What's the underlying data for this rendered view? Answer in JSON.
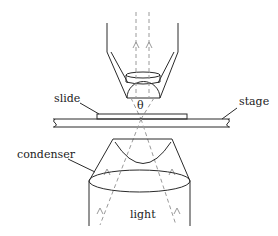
{
  "diagram": {
    "labels": {
      "slide": "slide",
      "stage": "stage",
      "condenser": "condenser",
      "light": "light",
      "angle": "θ"
    },
    "colors": {
      "outline": "#2a2a2a",
      "ray": "#9a9a9a",
      "background": "#ffffff"
    }
  }
}
